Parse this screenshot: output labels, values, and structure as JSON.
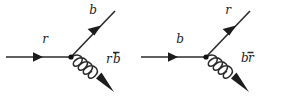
{
  "figure": {
    "type": "feynman-diagram-pair",
    "background_color": "#ffffff",
    "ink_color": "#2b2b2b"
  },
  "diagrams": [
    {
      "id": "left",
      "name": "red-quark-emits-gluon",
      "incoming": {
        "label": "r",
        "name": "incoming-quark-line",
        "direction": "right"
      },
      "outgoing": {
        "label": "b",
        "name": "outgoing-quark-line",
        "direction": "up-right"
      },
      "gluon": {
        "label_main": "r",
        "label_bar": "b",
        "label_combined": "rb̄",
        "name": "gluon-line",
        "direction": "down-right",
        "coils": 4
      }
    },
    {
      "id": "right",
      "name": "blue-quark-emits-gluon",
      "incoming": {
        "label": "b",
        "name": "incoming-quark-line",
        "direction": "right"
      },
      "outgoing": {
        "label": "r",
        "name": "outgoing-quark-line",
        "direction": "up-right"
      },
      "gluon": {
        "label_main": "b",
        "label_bar": "r",
        "label_combined": "br̄",
        "name": "gluon-line",
        "direction": "down-right",
        "coils": 4
      }
    }
  ]
}
